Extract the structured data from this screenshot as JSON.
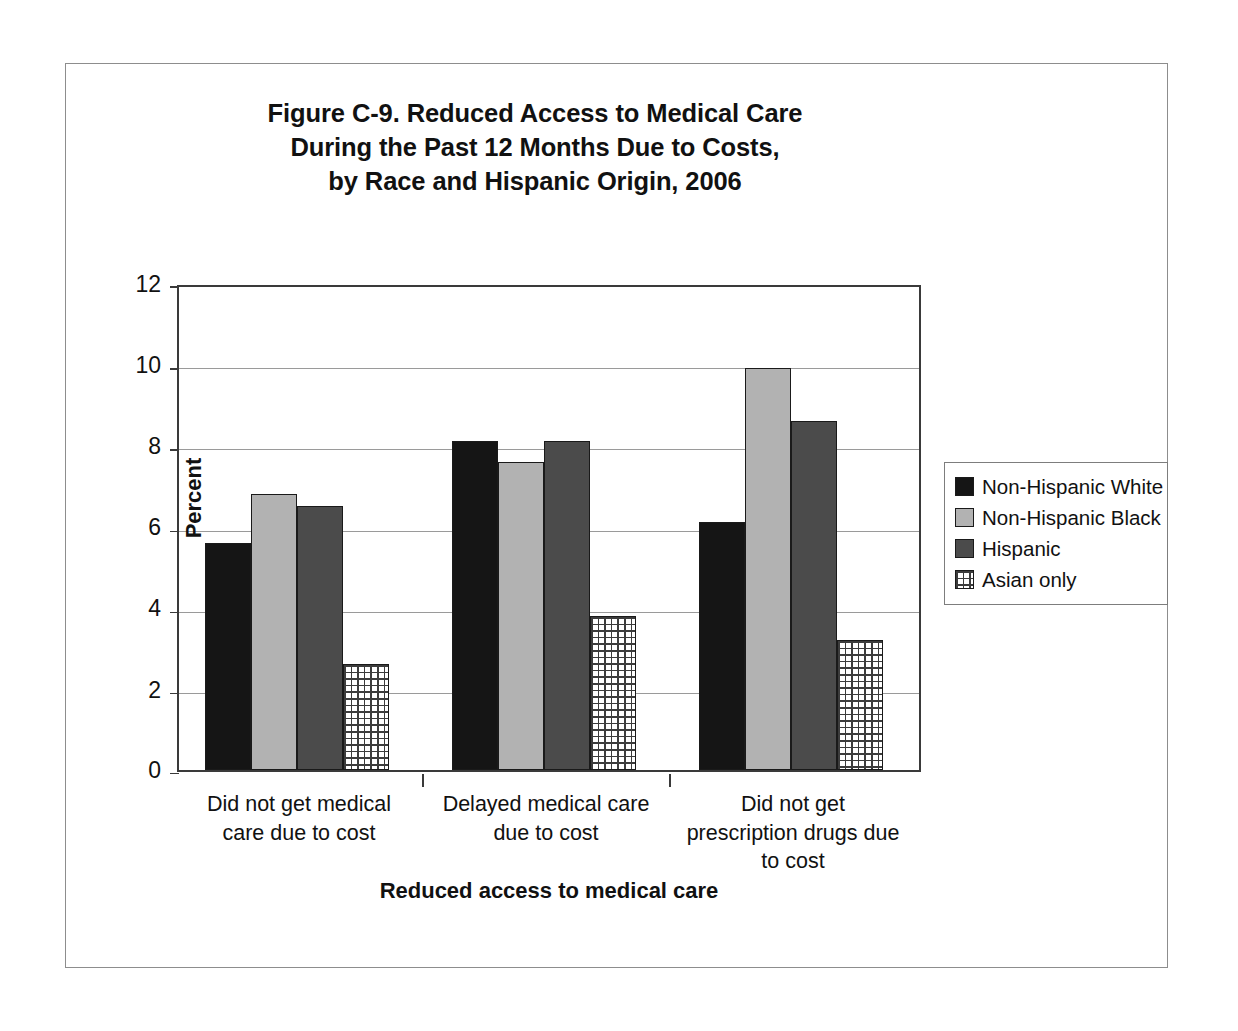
{
  "chart_data": {
    "type": "bar",
    "title": "Figure C-9. Reduced Access to Medical Care During the Past 12 Months Due to Costs, by Race and Hispanic Origin, 2006",
    "title_lines": [
      "Figure C-9. Reduced Access to Medical Care",
      "During the Past 12 Months Due to Costs,",
      "by Race and Hispanic Origin, 2006"
    ],
    "xlabel": "Reduced access to medical care",
    "ylabel": "Percent",
    "ylim": [
      0,
      12
    ],
    "ytick_labels": [
      "12",
      "10",
      "8",
      "6",
      "4",
      "2",
      "0"
    ],
    "ytick_values": [
      12,
      10,
      8,
      6,
      4,
      2,
      0
    ],
    "grid": true,
    "grid_axis": "y",
    "legend_position": "right",
    "categories": [
      "Did not get medical care due to cost",
      "Delayed medical care due to cost",
      "Did not get prescription drugs due to cost"
    ],
    "category_lines": [
      [
        "Did not get medical",
        "care due to cost"
      ],
      [
        "Delayed medical care",
        "due to cost"
      ],
      [
        "Did not get",
        "prescription drugs due",
        "to cost"
      ]
    ],
    "series": [
      {
        "name": "Non-Hispanic White",
        "color": "#151515",
        "pattern": "solid",
        "values": [
          5.6,
          8.1,
          6.1
        ]
      },
      {
        "name": "Non-Hispanic Black",
        "color": "#b2b2b2",
        "pattern": "solid",
        "values": [
          6.8,
          7.6,
          9.9
        ]
      },
      {
        "name": "Hispanic",
        "color": "#4b4b4b",
        "pattern": "solid",
        "values": [
          6.5,
          8.1,
          8.6
        ]
      },
      {
        "name": "Asian only",
        "color": "#ffffff",
        "pattern": "crosshatch",
        "values": [
          2.6,
          3.8,
          3.2
        ]
      }
    ]
  }
}
